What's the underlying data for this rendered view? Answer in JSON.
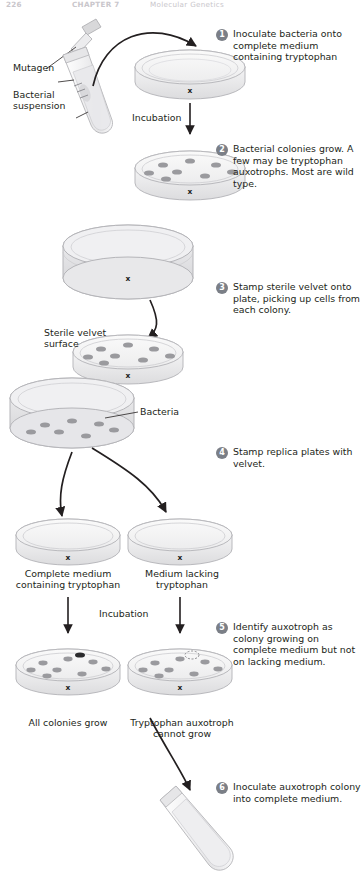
{
  "page": {
    "number": "226",
    "chapter": "CHAPTER 7",
    "chapter_title": "Molecular Genetics"
  },
  "steps": [
    {
      "num": "1",
      "text": "Inoculate bacteria onto complete medium containing tryptophan"
    },
    {
      "num": "2",
      "text": "Bacterial colonies grow. A few may be tryptophan auxotrophs. Most are wild type."
    },
    {
      "num": "3",
      "text": "Stamp sterile velvet onto plate, picking up cells from each colony."
    },
    {
      "num": "4",
      "text": "Stamp replica plates with velvet."
    },
    {
      "num": "5",
      "text": "Identify auxotroph as colony growing on complete medium but not on lacking medium."
    },
    {
      "num": "6",
      "text": "Inoculate auxotroph colony into complete medium."
    }
  ],
  "labels": {
    "mutagen": "Mutagen",
    "bacterial_suspension": "Bacterial\nsuspension",
    "bacterial_suspension_l1": "Bacterial",
    "bacterial_suspension_l2": "suspension",
    "incubation_1": "Incubation",
    "incubation_2": "Incubation",
    "sterile_velvet_l1": "Sterile velvet",
    "sterile_velvet_l2": "surface",
    "bacteria": "Bacteria",
    "complete_medium_l1": "Complete medium",
    "complete_medium_l2": "containing tryptophan",
    "lacking_medium_l1": "Medium lacking",
    "lacking_medium_l2": "tryptophan",
    "all_colonies_grow": "All colonies grow",
    "auxotroph_cannot_grow_l1": "Tryptophan auxotroph",
    "auxotroph_cannot_grow_l2": "cannot grow",
    "plate_mark": "x"
  },
  "colors": {
    "bullet_bg": "#7b7f87",
    "text": "#231f20",
    "plate_fill": "#f2f2f3",
    "plate_stroke": "#b9b9bd",
    "colony": "#9a9a9e",
    "velvet_fill": "#e2e2e4",
    "runhead": "#c9c6cb",
    "arrow": "#231f20"
  }
}
